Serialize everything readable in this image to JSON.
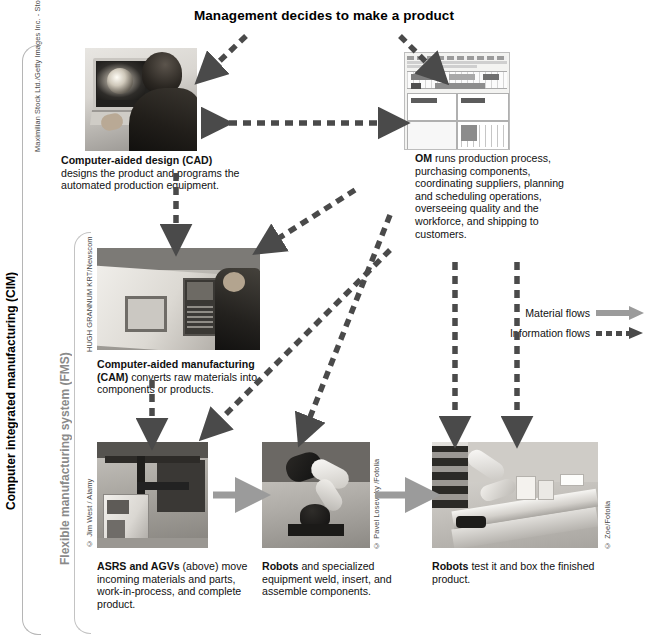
{
  "title": "Management decides to make a product",
  "brackets": {
    "cim": "Computer integrated manufacturing (CIM)",
    "fms": "Flexible manufacturing system (FMS)"
  },
  "nodes": {
    "cad": {
      "photo_name": "cad-workstation-photo",
      "credit": "Maximilian Stock Ltd./Getty Images Inc. - Stone Allstock",
      "caption_bold": "Computer-aided design (CAD)",
      "caption_rest": " designs the product and programs the automated production equipment."
    },
    "om": {
      "photo_name": "om-software-screenshot",
      "credit": "",
      "caption_bold": "OM",
      "caption_rest": " runs production process, purchasing components, coordinating suppliers, planning and scheduling operations, overseeing quality and the workforce, and shipping to customers."
    },
    "cam": {
      "photo_name": "cam-machine-operator-photo",
      "credit": "HUGH GRANNUM KRT/Newscom",
      "caption_bold": "Computer-aided manufacturing (CAM)",
      "caption_rest": " converts raw materials into components or products."
    },
    "asrs": {
      "photo_name": "asrs-agv-photo",
      "credit": "© Jim West / Alamy",
      "caption_bold": "ASRS and AGVs",
      "caption_rest": " (above) move incoming materials and parts, work-in-process, and complete product."
    },
    "robot_assemble": {
      "photo_name": "welding-robot-photo",
      "credit": "© Pavel Losevsky /Fotolia",
      "caption_bold": "Robots",
      "caption_rest": " and specialized equipment weld, insert, and assemble components."
    },
    "robot_test": {
      "photo_name": "testing-boxing-robot-photo",
      "credit": "© Zoe/Fotolia",
      "caption_bold": "Robots",
      "caption_rest": " test it and box the finished product."
    }
  },
  "legend": {
    "material_label": "Material flows",
    "information_label": "Information flows",
    "material_color": "#9b9b9b",
    "information_color": "#4a4a4a"
  },
  "diagram_flows": [
    {
      "from": "title",
      "to": "cad",
      "type": "information"
    },
    {
      "from": "title",
      "to": "om",
      "type": "information"
    },
    {
      "from": "cad",
      "to": "om",
      "type": "information",
      "bidirectional": true
    },
    {
      "from": "cad",
      "to": "cam",
      "type": "information"
    },
    {
      "from": "om",
      "to": "cam",
      "type": "information"
    },
    {
      "from": "om",
      "to": "asrs",
      "type": "information"
    },
    {
      "from": "om",
      "to": "robot_assemble",
      "type": "information"
    },
    {
      "from": "om",
      "to": "robot_test",
      "type": "information"
    },
    {
      "from": "cam",
      "to": "asrs",
      "type": "information"
    },
    {
      "from": "asrs",
      "to": "robot_assemble",
      "type": "material"
    },
    {
      "from": "robot_assemble",
      "to": "robot_test",
      "type": "material"
    }
  ]
}
